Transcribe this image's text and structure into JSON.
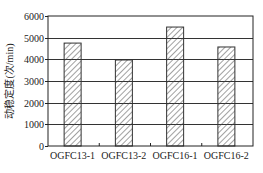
{
  "chart_data": {
    "type": "bar",
    "title": "",
    "xlabel": "",
    "ylabel": "动稳定度(次/min)",
    "categories": [
      "OGFC13-1",
      "OGFC13-2",
      "OGFC16-1",
      "OGFC16-2"
    ],
    "values": [
      4750,
      3970,
      5490,
      4570
    ],
    "ylim": [
      0,
      6000
    ],
    "yticks": [
      0,
      1000,
      2000,
      3000,
      4000,
      5000,
      6000
    ],
    "grid": true,
    "legend": null,
    "bar_fill": "diagonal-hatch",
    "colors": {
      "axis": "#222222",
      "grid": "#333333",
      "bar_stroke": "#333333",
      "hatch": "#444444",
      "background": "#ffffff"
    }
  }
}
